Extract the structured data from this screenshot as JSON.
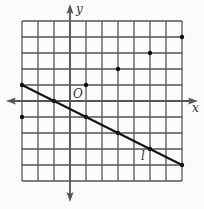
{
  "chart_data": {
    "type": "line",
    "title": "",
    "xlabel": "x",
    "ylabel": "y",
    "origin_label": "O",
    "xlim": [
      -3,
      7
    ],
    "ylim": [
      -5,
      5
    ],
    "grid": true,
    "grid_step": 1,
    "line": {
      "name": "l",
      "slope": -0.5,
      "intercept": -0.5,
      "from": [
        -3,
        1
      ],
      "to": [
        7,
        -4
      ]
    },
    "points": [
      {
        "x": 1,
        "y": 1
      },
      {
        "x": 3,
        "y": 2
      },
      {
        "x": 5,
        "y": 3
      },
      {
        "x": 7,
        "y": 4
      },
      {
        "x": -3,
        "y": -1
      },
      {
        "x": -3,
        "y": 1
      },
      {
        "x": -1,
        "y": 0
      },
      {
        "x": 1,
        "y": -1
      },
      {
        "x": 3,
        "y": -2
      },
      {
        "x": 5,
        "y": -3
      },
      {
        "x": 7,
        "y": -4
      }
    ]
  },
  "labels": {
    "x_axis": "x",
    "y_axis": "y",
    "origin": "O",
    "line": "l"
  },
  "colors": {
    "grid": "#555555",
    "axis": "#555555",
    "line": "#111111",
    "point": "#111111",
    "background": "#fbfbfb"
  }
}
